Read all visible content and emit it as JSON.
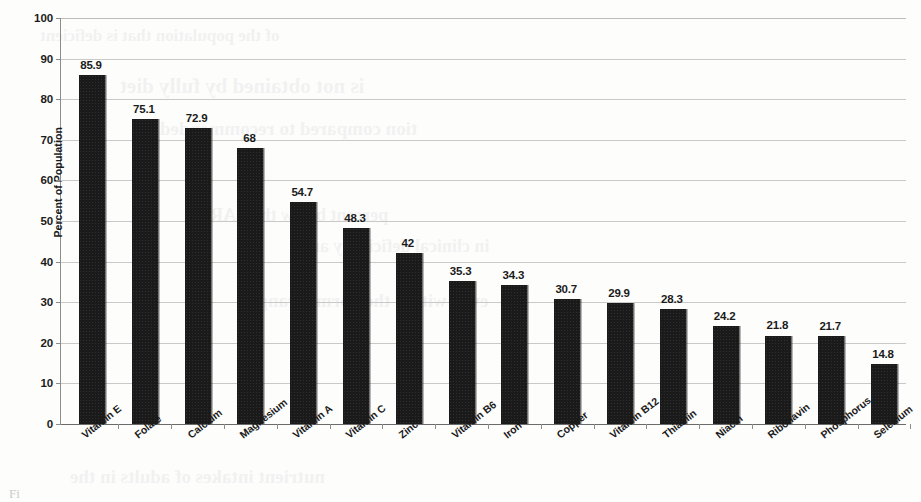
{
  "chart_data": {
    "type": "bar",
    "title": "",
    "xlabel": "",
    "ylabel": "Percent of Population",
    "ylim": [
      0,
      100
    ],
    "ytick_step": 10,
    "yticks": [
      "100",
      "90",
      "80",
      "70",
      "60",
      "50",
      "40",
      "30",
      "20",
      "10",
      "0"
    ],
    "grid": "horizontal",
    "legend": "none",
    "bar_color": "#1a1a1a",
    "categories": [
      "Vitamin E",
      "Folate",
      "Calcium",
      "Magnesium",
      "Vitamin A",
      "Vitamin C",
      "Zinc",
      "Vitamin B6",
      "Iron",
      "Copper",
      "Vitamin B12",
      "Thiamin",
      "Niacin",
      "Riboflavin",
      "Phosphorus",
      "Selenium"
    ],
    "values": [
      85.9,
      75.1,
      72.9,
      68,
      54.7,
      48.3,
      42,
      35.3,
      34.3,
      30.7,
      29.9,
      28.3,
      24.2,
      21.8,
      21.7,
      14.8
    ],
    "value_labels": [
      "85.9",
      "75.1",
      "72.9",
      "68",
      "54.7",
      "48.3",
      "42",
      "35.3",
      "34.3",
      "30.7",
      "29.9",
      "28.3",
      "24.2",
      "21.8",
      "21.7",
      "14.8"
    ]
  },
  "page": {
    "caption_stub": "Fi",
    "bleed_lines": [
      "of the population that is deficient",
      "is not obtained by fully diet",
      "tion compared to recommended",
      "percent below the EAR",
      "in clinical deficiency and",
      "even within the normal range",
      "nutrient intakes of adults in the"
    ]
  }
}
